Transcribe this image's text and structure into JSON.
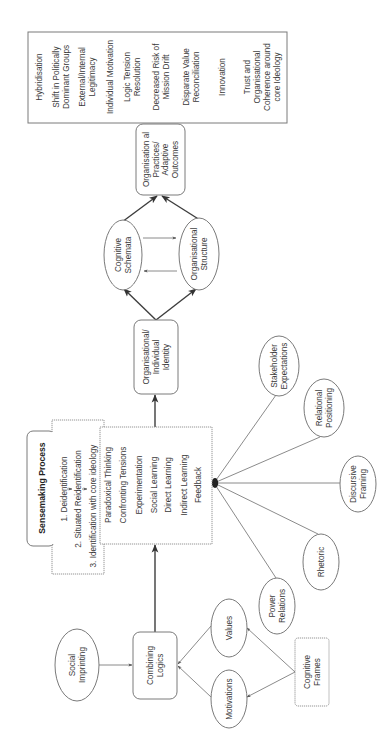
{
  "diagram": {
    "orientation": "rotated-90-counterclockwise",
    "nodes": {
      "social_imprinting": {
        "lines": [
          "Social",
          "Imprinting"
        ],
        "shape": "ellipse"
      },
      "combining_logics": {
        "lines": [
          "Combining",
          "Logics"
        ],
        "shape": "rounded-box"
      },
      "values": {
        "lines": [
          "Values"
        ],
        "shape": "ellipse"
      },
      "motivations": {
        "lines": [
          "Motivations"
        ],
        "shape": "ellipse"
      },
      "cognitive_frames": {
        "lines": [
          "Cognitive",
          "Frames"
        ],
        "shape": "box"
      },
      "sensemaking": {
        "title": "Sensemaking Process",
        "stages": [
          "1. Deidentification",
          "2. Situated Reidentification",
          "3. Identification with core ideology"
        ]
      },
      "practices": {
        "items": [
          "Paradoxical Thinking",
          "Confronting Tensions",
          "Experimentation",
          "Social Learning",
          "Direct Learning",
          "Indirect Learning",
          "Feedback"
        ]
      },
      "power_relations": {
        "lines": [
          "Power",
          "Relations"
        ],
        "shape": "ellipse"
      },
      "rhetoric": {
        "lines": [
          "Rhetoric"
        ],
        "shape": "ellipse"
      },
      "discursive_framing": {
        "lines": [
          "Discursive",
          "Framing"
        ],
        "shape": "ellipse"
      },
      "relational_positioning": {
        "lines": [
          "Relational",
          "Positioning"
        ],
        "shape": "ellipse"
      },
      "stakeholder_expectations": {
        "lines": [
          "Stakeholder",
          "Expectations"
        ],
        "shape": "ellipse"
      },
      "identity": {
        "lines": [
          "Organisational/",
          "Individual",
          "Identity"
        ],
        "shape": "rounded-box"
      },
      "cognitive_schemata": {
        "lines": [
          "Cognitive",
          "Schemata"
        ],
        "shape": "ellipse"
      },
      "organisational_structure": {
        "lines": [
          "Organisational",
          "Structure"
        ],
        "shape": "ellipse"
      },
      "adaptive_outcomes": {
        "lines": [
          "Organisation al",
          "Practices/",
          "Adaptive",
          "Outcomes"
        ],
        "shape": "rounded-box"
      },
      "outcomes_list": {
        "items": [
          [
            "Hybridisation"
          ],
          [
            "Shift in Politically",
            "Dominant Groups"
          ],
          [
            "External/Internal",
            "Legitimacy"
          ],
          [
            "Individual Motivation"
          ],
          [
            "Logic Tension",
            "Resolution"
          ],
          [
            "Decreased Risk of",
            "Mission Drift"
          ],
          [
            "Disparate Value",
            "Reconciliation"
          ],
          [
            "Innovation"
          ],
          [
            "Trust and",
            "Organisational",
            "Coherence around",
            "core Ideology"
          ]
        ]
      }
    },
    "edges": [
      {
        "from": "social_imprinting",
        "to": "combining_logics",
        "arrow": true
      },
      {
        "from": "values",
        "to": "combining_logics",
        "arrow": true
      },
      {
        "from": "motivations",
        "to": "combining_logics",
        "arrow": true
      },
      {
        "from": "cognitive_frames",
        "to": "values",
        "arrow": true
      },
      {
        "from": "cognitive_frames",
        "to": "motivations",
        "arrow": true
      },
      {
        "from": "combining_logics",
        "to": "practices",
        "arrow": true
      },
      {
        "from": "power_relations",
        "to": "practices",
        "arrow": false
      },
      {
        "from": "rhetoric",
        "to": "practices",
        "arrow": false
      },
      {
        "from": "discursive_framing",
        "to": "practices",
        "arrow": false
      },
      {
        "from": "relational_positioning",
        "to": "practices",
        "arrow": false
      },
      {
        "from": "stakeholder_expectations",
        "to": "practices",
        "arrow": false
      },
      {
        "from": "practices",
        "to": "identity",
        "arrow": true
      },
      {
        "from": "identity",
        "to": "cognitive_schemata",
        "arrow": true
      },
      {
        "from": "identity",
        "to": "organisational_structure",
        "arrow": true
      },
      {
        "from": "cognitive_schemata",
        "to": "organisational_structure",
        "arrow": true
      },
      {
        "from": "organisational_structure",
        "to": "cognitive_schemata",
        "arrow": true
      },
      {
        "from": "cognitive_schemata",
        "to": "adaptive_outcomes",
        "arrow": true
      },
      {
        "from": "organisational_structure",
        "to": "adaptive_outcomes",
        "arrow": true
      }
    ]
  }
}
